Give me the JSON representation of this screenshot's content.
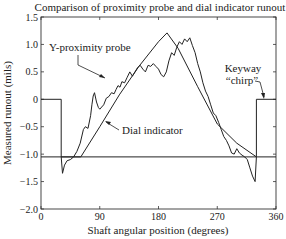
{
  "chart_data": {
    "type": "line",
    "title": "Comparison of proximity probe and dial indicator runout",
    "xlabel": "Shaft angular position (degrees)",
    "ylabel": "Measured runout (mils)",
    "xlim": [
      0,
      360
    ],
    "ylim": [
      -2.0,
      1.5
    ],
    "xticks": [
      0,
      90,
      180,
      270,
      360
    ],
    "xtick_labels": [
      "0",
      "90",
      "180",
      "270",
      "360"
    ],
    "yticks": [
      -2.0,
      -1.5,
      -1.0,
      -0.5,
      0,
      0.5,
      1.0,
      1.5
    ],
    "ytick_labels": [
      "−2.0",
      "−1.5",
      "−1.0",
      "−0.5",
      "0",
      "0.5",
      "1.0",
      "1.5"
    ],
    "grid": false,
    "series": [
      {
        "name": "Keyway chirp",
        "x": [
          0,
          31,
          31,
          330,
          330,
          360
        ],
        "y": [
          0,
          0,
          -1.05,
          -1.05,
          0,
          0
        ]
      },
      {
        "name": "Dial indicator",
        "x": [
          0,
          61,
          90,
          120,
          150,
          180,
          193,
          210,
          240,
          270,
          300,
          330,
          360
        ],
        "y": [
          -1.05,
          -1.05,
          -0.5,
          0.08,
          0.6,
          1.05,
          1.21,
          0.93,
          0.23,
          -0.45,
          -0.8,
          -1.05,
          -1.05
        ]
      },
      {
        "name": "Y-proximity probe",
        "x": [
          31,
          33,
          36,
          40,
          45,
          50,
          55,
          60,
          65,
          68,
          72,
          76,
          78,
          80,
          82,
          85,
          88,
          90,
          93,
          96,
          100,
          104,
          108,
          112,
          115,
          118,
          121,
          124,
          128,
          132,
          136,
          140,
          144,
          148,
          152,
          156,
          160,
          164,
          168,
          172,
          176,
          180,
          184,
          188,
          192,
          196,
          200,
          204,
          208,
          212,
          216,
          220,
          224,
          228,
          232,
          236,
          240,
          244,
          248,
          252,
          256,
          260,
          264,
          268,
          272,
          276,
          280,
          284,
          288,
          292,
          296,
          300,
          304,
          308,
          312,
          316,
          320,
          324,
          328,
          330
        ],
        "y": [
          -1.05,
          -1.35,
          -1.2,
          -1.12,
          -1.1,
          -1.05,
          -0.95,
          -0.8,
          -0.55,
          -0.5,
          -0.53,
          -0.3,
          -0.1,
          0.06,
          0.12,
          -0.05,
          -0.15,
          -0.18,
          -0.14,
          -0.1,
          0.02,
          0.05,
          0.12,
          0.1,
          0.18,
          0.25,
          0.22,
          0.32,
          0.3,
          0.4,
          0.5,
          0.42,
          0.5,
          0.58,
          0.62,
          0.55,
          0.5,
          0.62,
          0.6,
          0.65,
          0.6,
          0.55,
          0.45,
          0.41,
          0.5,
          0.7,
          0.85,
          0.8,
          0.95,
          1.05,
          1.0,
          1.1,
          1.05,
          1.12,
          0.98,
          0.85,
          0.65,
          0.5,
          0.3,
          0.15,
          0.05,
          -0.1,
          -0.25,
          -0.3,
          -0.42,
          -0.55,
          -0.68,
          -0.75,
          -0.85,
          -0.98,
          -1.0,
          -0.9,
          -0.98,
          -1.02,
          -1.05,
          -1.1,
          -1.25,
          -1.4,
          -1.5,
          -1.05
        ]
      }
    ],
    "annotations": [
      {
        "text": "Y-proximity probe",
        "arrow_to": [
          108,
          0.05
        ]
      },
      {
        "text": "Dial indicator",
        "arrow_to": [
          93,
          -0.45
        ]
      },
      {
        "text": "Keyway",
        "line2": "“chirp”",
        "arrow_to": [
          330,
          0
        ]
      }
    ],
    "legend": "none (inline annotations)"
  }
}
